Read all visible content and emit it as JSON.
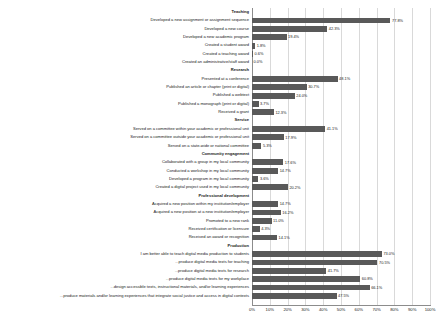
{
  "chart_data": {
    "type": "bar",
    "orientation": "horizontal",
    "title": "",
    "xlabel": "",
    "ylabel": "",
    "xlim": [
      0,
      100
    ],
    "xticks": [
      "0%",
      "10%",
      "20%",
      "30%",
      "40%",
      "50%",
      "60%",
      "70%",
      "80%",
      "90%",
      "100%"
    ],
    "xtick_values": [
      0,
      10,
      20,
      30,
      40,
      50,
      60,
      70,
      80,
      90,
      100
    ],
    "grid": true,
    "legend": "none",
    "bar_color": "#595959",
    "value_label_suffix": "%",
    "groups": [
      {
        "name": "Teaching",
        "categories": [
          "Developed a new assignment or assignment sequence",
          "Developed a new course",
          "Developed a new academic program",
          "Created a student award",
          "Created a teaching award",
          "Created an administrative/staff award"
        ],
        "values": [
          77.8,
          42.3,
          19.4,
          1.8,
          0.6,
          0.0
        ],
        "value_labels": [
          "77.8%",
          "42.3%",
          "19.4%",
          "1.8%",
          "0.6%",
          "0.0%"
        ]
      },
      {
        "name": "Research",
        "categories": [
          "Presented at a conference",
          "Published an article or chapter (print or digital)",
          "Published a webtext",
          "Published a monograph (print or digital)",
          "Received a grant"
        ],
        "values": [
          48.1,
          30.7,
          24.0,
          3.7,
          12.3
        ],
        "value_labels": [
          "48.1%",
          "30.7%",
          "24.0%",
          "3.7%",
          "12.3%"
        ]
      },
      {
        "name": "Service",
        "categories": [
          "Served on a committee within your academic or professional unit",
          "Served on a committee outside your academic or professional unit",
          "Served on a state-wide or national committee"
        ],
        "values": [
          41.1,
          17.9,
          5.3
        ],
        "value_labels": [
          "41.1%",
          "17.9%",
          "5.3%"
        ]
      },
      {
        "name": "Community engagement",
        "categories": [
          "Collaborated with a group in my local community",
          "Conducted a workshop in my local community",
          "Developed a program in my local community",
          "Created a digital project used in my local community"
        ],
        "values": [
          17.6,
          14.7,
          3.6,
          20.2
        ],
        "value_labels": [
          "17.6%",
          "14.7%",
          "3.6%",
          "20.2%"
        ]
      },
      {
        "name": "Professional development",
        "categories": [
          "Acquired a new position within my institution/employer",
          "Acquired a new position at a new institution/employer",
          "Promoted to a new rank",
          "Received certification or licensure",
          "Received an award or recognition"
        ],
        "values": [
          14.7,
          16.2,
          11.0,
          4.3,
          14.1
        ],
        "value_labels": [
          "14.7%",
          "16.2%",
          "11.0%",
          "4.3%",
          "14.1%"
        ]
      },
      {
        "name": "Production",
        "categories": [
          "I am better able to  teach digital media production to students",
          "...produce digital media texts for teaching",
          "...produce digital media texts for research",
          "...produce digital media texts for my workplace",
          "...design accessible texts, instructional materials, and/or learning experiences",
          "...produce materials and/or learning experiences that integrate social justice and access in digital contexts"
        ],
        "values": [
          73.0,
          70.5,
          41.7,
          60.8,
          66.1,
          47.5
        ],
        "value_labels": [
          "73.0%",
          "70.5%",
          "41.7%",
          "60.8%",
          "66.1%",
          "47.5%"
        ]
      }
    ]
  }
}
